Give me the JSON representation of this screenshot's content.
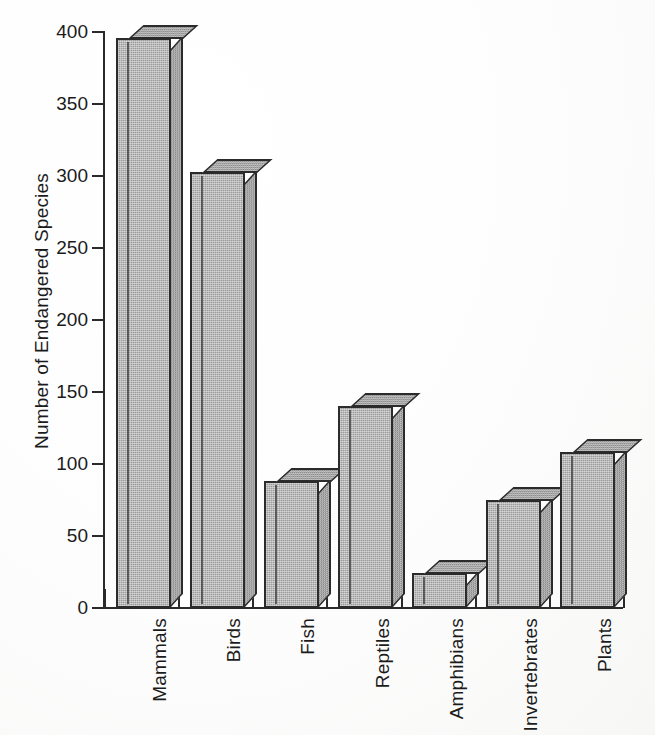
{
  "chart_data": {
    "type": "bar",
    "title": "",
    "xlabel": "",
    "ylabel": "Number of Endangered Species",
    "categories": [
      "Mammals",
      "Birds",
      "Fish",
      "Reptiles",
      "Amphibians",
      "Invertebrates",
      "Plants"
    ],
    "values": [
      396,
      303,
      88,
      140,
      24,
      75,
      108
    ],
    "ylim": [
      0,
      400
    ],
    "yticks": [
      0,
      50,
      100,
      150,
      200,
      250,
      300,
      350,
      400
    ],
    "ytick_labels": [
      "0",
      "50",
      "100",
      "150",
      "200",
      "250",
      "300",
      "350",
      "400"
    ],
    "grid": false,
    "legend": false,
    "style": {
      "bar_fill": "#9b9b9b",
      "bar_outline": "#2b2b2b",
      "axis_color": "#2a2a2a",
      "background": "#ffffff",
      "three_d": true,
      "xtick_label_rotation": 90
    }
  },
  "caption": ""
}
